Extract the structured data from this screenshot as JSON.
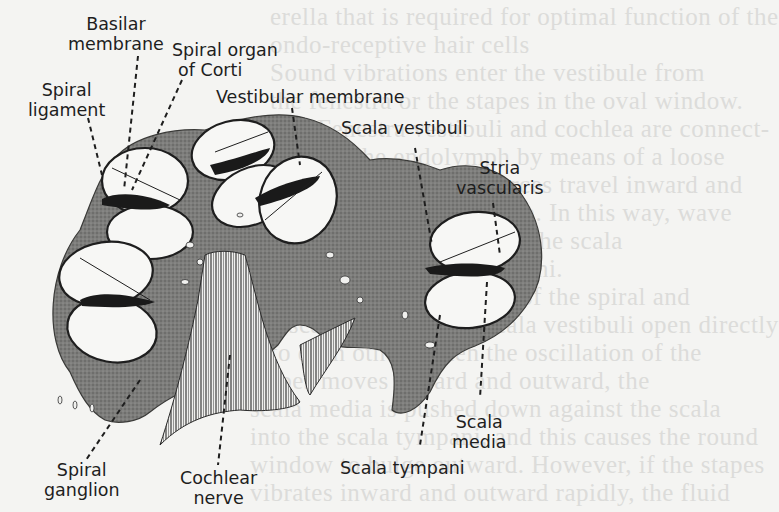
{
  "figure": {
    "colors": {
      "paper": "#f4f4f2",
      "bone_tissue": "#8a8a88",
      "ink": "#1e1e1e",
      "duct_interior": "#f7f7f5",
      "bleed_through_text": "#dcdcda"
    }
  },
  "labels": {
    "basilar_membrane": {
      "line1": "Basilar",
      "line2": "membrane"
    },
    "spiral_organ": {
      "line1": "Spiral organ",
      "line2": "of Corti"
    },
    "spiral_ligament": {
      "line1": "Spiral",
      "line2": "ligament"
    },
    "vestibular_membrane": {
      "line1": "Vestibular membrane"
    },
    "scala_vestibuli": {
      "line1": "Scala vestibuli"
    },
    "stria_vascularis": {
      "line1": "Stria",
      "line2": "vascularis"
    },
    "scala_media": {
      "line1": "Scala",
      "line2": "media"
    },
    "scala_tympani": {
      "line1": "Scala tympani"
    },
    "cochlear_nerve": {
      "line1": "Cochlear",
      "line2": "nerve"
    },
    "spiral_ganglion": {
      "line1": "Spiral",
      "line2": "ganglion"
    }
  },
  "background_bleed": [
    "erella that is required for optimal function of the",
    "ondo-receptive hair cells",
    "Sound vibrations enter the vestibule from",
    "the fenestra or the stapes in the oval window.",
    "The Fenestra vestibuli and cochlea are connect-",
    "ed with the endolymph by means of a loose",
    "membrane. Pressure forces travel inward and",
    "outward in the perilymph. In this way, wave",
    "forces are transmitted to the scala",
    "vestibuli and scala tympani.",
    "Scala from the upper end of the spiral and",
    "the scala tympani and scala vestibuli open directly",
    "into each other. When the oscillation of the",
    "stapes moves inward and outward, the",
    "scala media is pushed down against the scala",
    "into the scala tympani, and this causes the round",
    "window to bulge outward. However, if the stapes",
    "vibrates inward and outward rapidly, the fluid"
  ]
}
